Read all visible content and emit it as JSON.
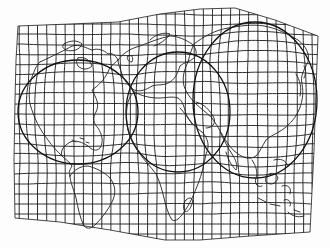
{
  "map": {
    "type": "distorted-world-map",
    "description": "World map drawn on a warped graticule with three magnified circular regions",
    "style": {
      "ink_color": "#1a1a1a",
      "paper_color": "#fdfdfd"
    },
    "outline": {
      "points": [
        [
          18,
          26
        ],
        [
          70,
          24
        ],
        [
          118,
          22
        ],
        [
          160,
          14
        ],
        [
          200,
          9
        ],
        [
          235,
          8
        ],
        [
          275,
          20
        ],
        [
          318,
          36
        ],
        [
          316,
          90
        ],
        [
          314,
          150
        ],
        [
          310,
          232
        ],
        [
          250,
          236
        ],
        [
          200,
          240
        ],
        [
          165,
          240
        ],
        [
          110,
          230
        ],
        [
          60,
          222
        ],
        [
          15,
          218
        ],
        [
          14,
          160
        ],
        [
          15,
          100
        ],
        [
          16,
          60
        ]
      ]
    },
    "grid": {
      "columns": 34,
      "rows": 24
    },
    "lenses": [
      {
        "name": "north-america-lens",
        "cx": 78,
        "cy": 112,
        "rx": 60,
        "ry": 52
      },
      {
        "name": "europe-africa-lens",
        "cx": 178,
        "cy": 112,
        "rx": 52,
        "ry": 60
      },
      {
        "name": "asia-lens",
        "cx": 255,
        "cy": 100,
        "rx": 62,
        "ry": 78
      }
    ],
    "features": [
      "North America",
      "South America",
      "Europe",
      "Africa",
      "Asia",
      "Madagascar",
      "Southeast Asia",
      "Japan"
    ]
  }
}
